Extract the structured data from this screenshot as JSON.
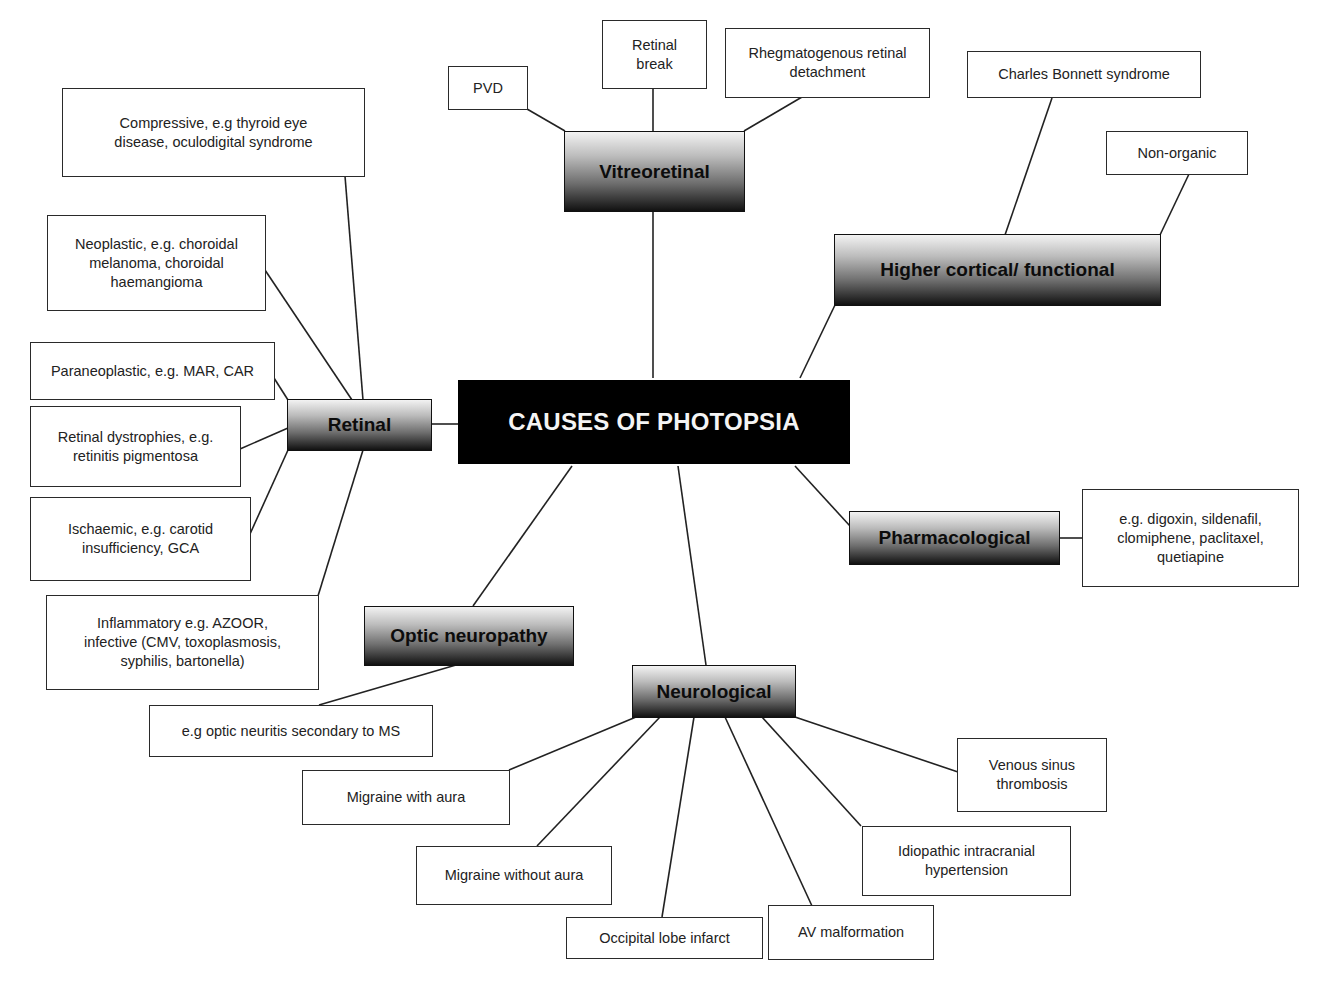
{
  "title": "CAUSES OF PHOTOPSIA",
  "colors": {
    "root_bg": "#000000",
    "root_text": "#f4f4f4",
    "line": "#222222",
    "box_border": "#2a2a2a"
  },
  "categories": {
    "vitreoretinal": {
      "label": "Vitreoretinal",
      "items": [
        "PVD",
        "Retinal break",
        "Rhegmatogenous retinal detachment"
      ]
    },
    "higher_cortical": {
      "label": "Higher cortical/ functional",
      "items": [
        "Charles Bonnett syndrome",
        "Non-organic"
      ]
    },
    "retinal": {
      "label": "Retinal",
      "items": [
        "Compressive, e.g thyroid eye disease, oculodigital syndrome",
        "Neoplastic, e.g. choroidal melanoma, choroidal haemangioma",
        "Paraneoplastic, e.g. MAR, CAR",
        "Retinal dystrophies, e.g. retinitis pigmentosa",
        "Ischaemic, e.g. carotid insufficiency, GCA",
        "Inflammatory e.g. AZOOR, infective (CMV, toxoplasmosis, syphilis, bartonella)"
      ]
    },
    "pharmacological": {
      "label": "Pharmacological",
      "items": [
        "e.g. digoxin, sildenafil, clomiphene, paclitaxel, quetiapine"
      ]
    },
    "optic_neuropathy": {
      "label": "Optic neuropathy",
      "items": [
        "e.g optic neuritis secondary to MS"
      ]
    },
    "neurological": {
      "label": "Neurological",
      "items": [
        "Migraine with aura",
        "Migraine without aura",
        "Occipital lobe infarct",
        "AV malformation",
        "Idiopathic intracranial hypertension",
        "Venous sinus thrombosis"
      ]
    }
  }
}
